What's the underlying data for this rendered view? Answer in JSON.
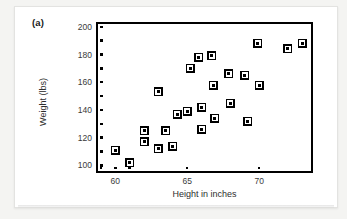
{
  "figure": {
    "panel_label": "(a)",
    "background_color": "#f4f4f2",
    "card_color": "#ffffff",
    "marker_color": "#000000",
    "axis_color": "#000000"
  },
  "chart_data": {
    "type": "scatter",
    "title": "",
    "xlabel": "Height in inches",
    "ylabel": "Weight (lbs)",
    "xlim": [
      58.8,
      73.6
    ],
    "ylim": [
      96,
      202
    ],
    "xticks": [
      60,
      65,
      70
    ],
    "xtick_labels": [
      "60",
      "65",
      "70"
    ],
    "yticks": [
      100,
      120,
      140,
      160,
      180,
      200
    ],
    "ytick_labels": [
      "100",
      "120",
      "140",
      "160",
      "180",
      "200"
    ],
    "x_minor_tick_step": 1,
    "y_minor_tick_step": 10,
    "grid": false,
    "legend": false,
    "marker_style": "square-open-with-dot",
    "points": [
      {
        "x": 60.0,
        "y": 111
      },
      {
        "x": 61.0,
        "y": 102
      },
      {
        "x": 62.0,
        "y": 125
      },
      {
        "x": 62.0,
        "y": 117
      },
      {
        "x": 63.0,
        "y": 153
      },
      {
        "x": 63.0,
        "y": 112
      },
      {
        "x": 63.5,
        "y": 125
      },
      {
        "x": 64.0,
        "y": 114
      },
      {
        "x": 64.3,
        "y": 137
      },
      {
        "x": 65.0,
        "y": 139
      },
      {
        "x": 65.2,
        "y": 170
      },
      {
        "x": 65.8,
        "y": 178
      },
      {
        "x": 66.0,
        "y": 142
      },
      {
        "x": 66.0,
        "y": 126
      },
      {
        "x": 66.7,
        "y": 179
      },
      {
        "x": 66.8,
        "y": 158
      },
      {
        "x": 66.9,
        "y": 134
      },
      {
        "x": 67.9,
        "y": 166
      },
      {
        "x": 68.0,
        "y": 145
      },
      {
        "x": 69.0,
        "y": 165
      },
      {
        "x": 69.2,
        "y": 132
      },
      {
        "x": 69.9,
        "y": 188
      },
      {
        "x": 70.0,
        "y": 158
      },
      {
        "x": 72.0,
        "y": 184
      },
      {
        "x": 73.0,
        "y": 188
      }
    ]
  }
}
